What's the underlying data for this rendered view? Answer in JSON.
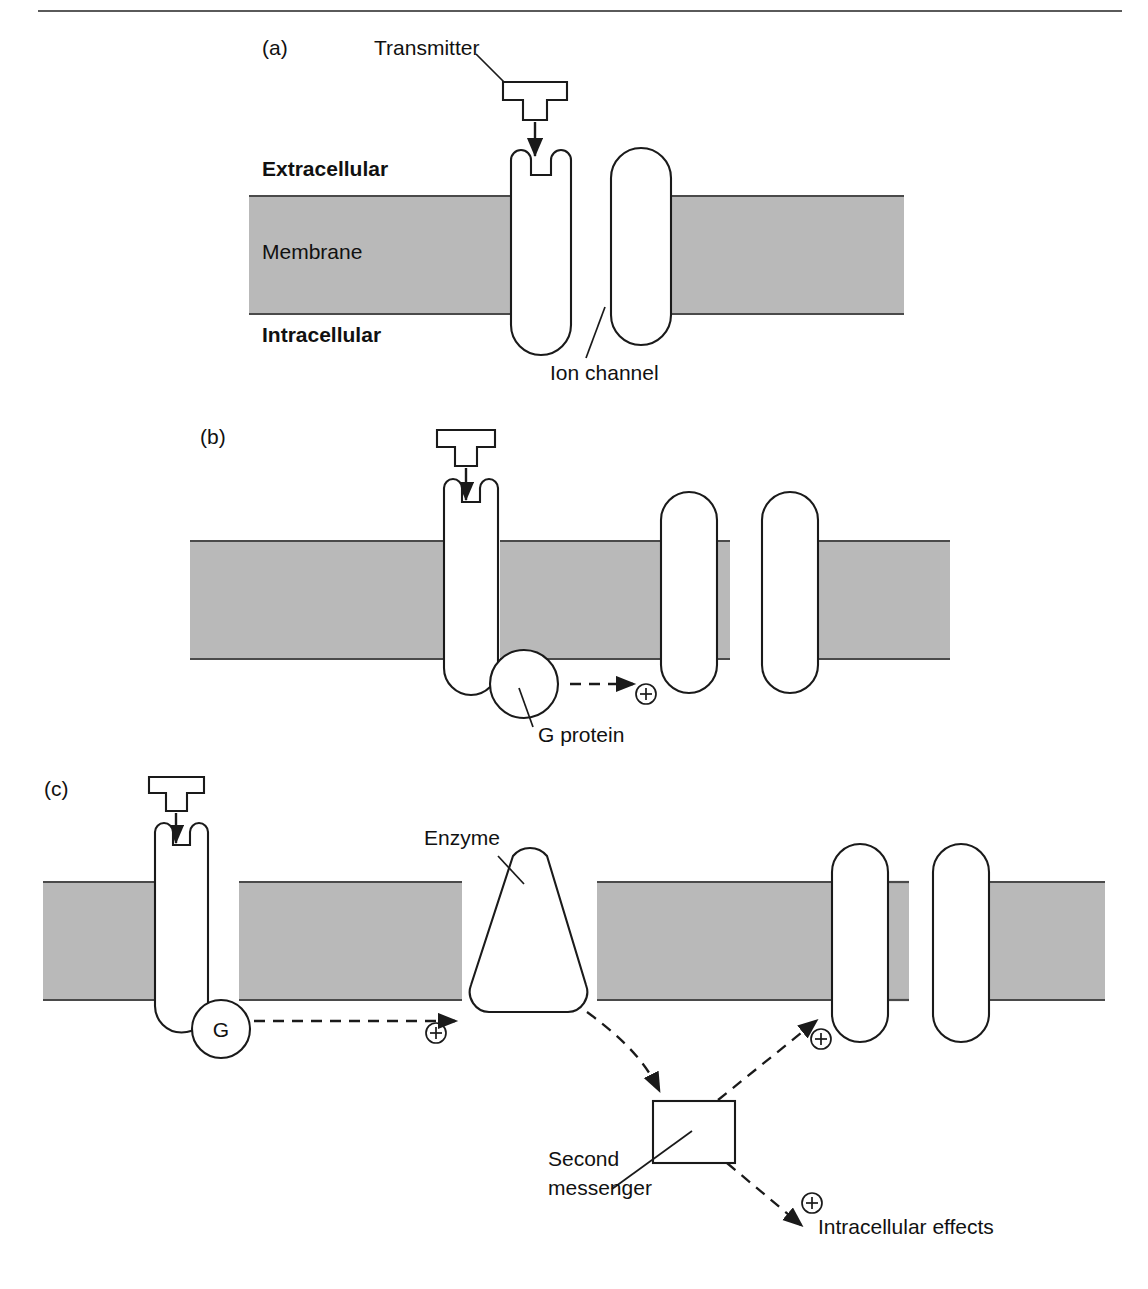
{
  "figure": {
    "colors": {
      "membrane_fill": "#b9b9b9",
      "membrane_edge": "#4a4a4a",
      "outline": "#1a1a1a",
      "background": "#ffffff"
    }
  },
  "panels": [
    {
      "id": "a",
      "label": "(a)",
      "labels": {
        "transmitter": "Transmitter",
        "extracellular": "Extracellular",
        "membrane": "Membrane",
        "intracellular": "Intracellular",
        "ion_channel": "Ion channel"
      }
    },
    {
      "id": "b",
      "label": "(b)",
      "labels": {
        "g_protein": "G protein"
      },
      "signs": [
        "plus"
      ]
    },
    {
      "id": "c",
      "label": "(c)",
      "labels": {
        "enzyme": "Enzyme",
        "g_letter": "G",
        "second_messenger_line1": "Second",
        "second_messenger_line2": "messenger",
        "intracellular_effects": "Intracellular effects"
      },
      "signs": [
        "plus",
        "plus",
        "plus"
      ]
    }
  ],
  "glyphs": {
    "plus_sign": "⊕"
  }
}
